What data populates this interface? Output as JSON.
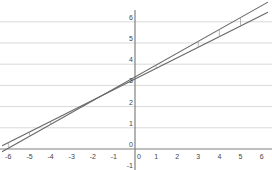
{
  "chart_data": {
    "type": "line",
    "title": "",
    "xlabel": "",
    "ylabel": "",
    "xlim": [
      -6.2,
      6.3
    ],
    "ylim": [
      -1,
      6.6
    ],
    "grid": {
      "horizontal": true,
      "vertical": false
    },
    "legend": null,
    "x_ticks": [
      -6,
      -5,
      -4,
      -3,
      -2,
      -1,
      0,
      1,
      2,
      3,
      4,
      5,
      6
    ],
    "y_ticks": [
      -1,
      0,
      1,
      2,
      3,
      4,
      5,
      6
    ],
    "series": [
      {
        "name": "line-steep",
        "points": [
          [
            -6.2,
            0.0
          ],
          [
            0,
            3.4
          ],
          [
            4.7,
            6.5
          ]
        ],
        "slope": 0.56,
        "intercept": 3.4
      },
      {
        "name": "line-shallow",
        "points": [
          [
            -6.2,
            0.5
          ],
          [
            0,
            3.3
          ],
          [
            6,
            6.5
          ]
        ],
        "slope": 0.5,
        "intercept": 3.3
      }
    ],
    "annotations": {
      "residual_segments_x": [
        -6,
        -5,
        -4,
        1,
        3,
        4,
        5
      ]
    }
  },
  "colors": {
    "grid": "#d9d9d9",
    "axis": "#808080",
    "line": "#666666",
    "text": "#444444"
  }
}
